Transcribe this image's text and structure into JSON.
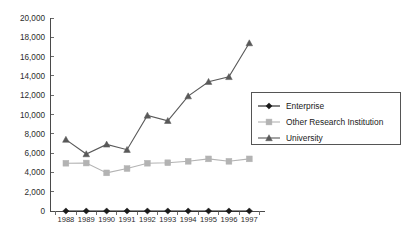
{
  "chart_data": {
    "type": "line",
    "title": "",
    "xlabel": "",
    "ylabel": "",
    "ylim": [
      0,
      20000
    ],
    "grid": false,
    "legend_position": "right",
    "categories": [
      "1988",
      "1989",
      "1990",
      "1991",
      "1992",
      "1993",
      "1994",
      "1995",
      "1996",
      "1997"
    ],
    "ytick_labels": [
      "0",
      "2,000",
      "4,000",
      "6,000",
      "8,000",
      "10,000",
      "12,000",
      "14,000",
      "16,000",
      "18,000",
      "20,000"
    ],
    "ytick_values": [
      0,
      2000,
      4000,
      6000,
      8000,
      10000,
      12000,
      14000,
      16000,
      18000,
      20000
    ],
    "series": [
      {
        "name": "Enterprise",
        "marker": "diamond",
        "color": "#1a1a1a",
        "values": [
          0,
          0,
          0,
          0,
          0,
          0,
          0,
          0,
          0,
          0
        ]
      },
      {
        "name": "Other Research Institution",
        "marker": "square",
        "color": "#b3b3b3",
        "values": [
          4950,
          4970,
          3950,
          4400,
          4950,
          5000,
          5150,
          5400,
          5150,
          5400
        ]
      },
      {
        "name": "University",
        "marker": "triangle",
        "color": "#595959",
        "values": [
          7400,
          5900,
          6900,
          6350,
          9900,
          9350,
          11900,
          13400,
          13900,
          17400
        ]
      }
    ]
  },
  "legend": {
    "items": [
      {
        "label": "Enterprise"
      },
      {
        "label": "Other Research Institution"
      },
      {
        "label": "University"
      }
    ]
  }
}
